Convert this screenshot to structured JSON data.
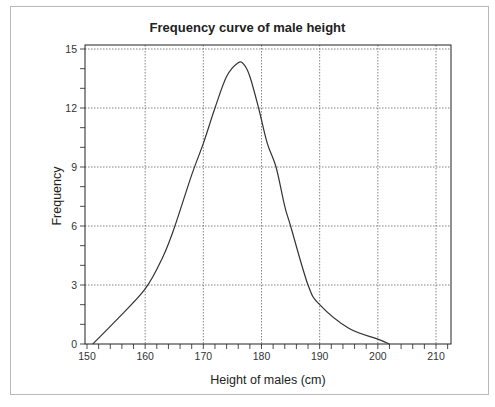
{
  "chart_data": {
    "type": "line",
    "title": "Frequency curve of male height",
    "xlabel": "Height of males (cm)",
    "ylabel": "Frequency",
    "xlim": [
      150,
      212
    ],
    "ylim": [
      0,
      15
    ],
    "x_ticks": [
      150,
      160,
      170,
      180,
      190,
      200,
      210
    ],
    "y_ticks": [
      0,
      3,
      6,
      9,
      12,
      15
    ],
    "x_minor_step": 2,
    "y_minor_step": 1,
    "grid": true,
    "legend": null,
    "series": [
      {
        "name": "Frequency curve",
        "color": "#333333",
        "x": [
          151,
          155,
          160,
          163,
          165,
          168,
          170,
          172,
          174,
          176,
          177,
          178,
          179.5,
          181,
          182.5,
          184,
          185,
          188,
          190,
          195,
          200,
          202
        ],
        "y": [
          0,
          1.2,
          2.8,
          4.4,
          5.9,
          8.6,
          10.2,
          12.0,
          13.6,
          14.3,
          14.2,
          13.6,
          12.0,
          10.2,
          9.0,
          7.0,
          6.0,
          3.0,
          2.0,
          0.8,
          0.25,
          0
        ]
      }
    ]
  },
  "colors": {
    "line": "#333333",
    "grid": "#666666",
    "axis": "#222222",
    "frame": "#b8b8b8"
  }
}
